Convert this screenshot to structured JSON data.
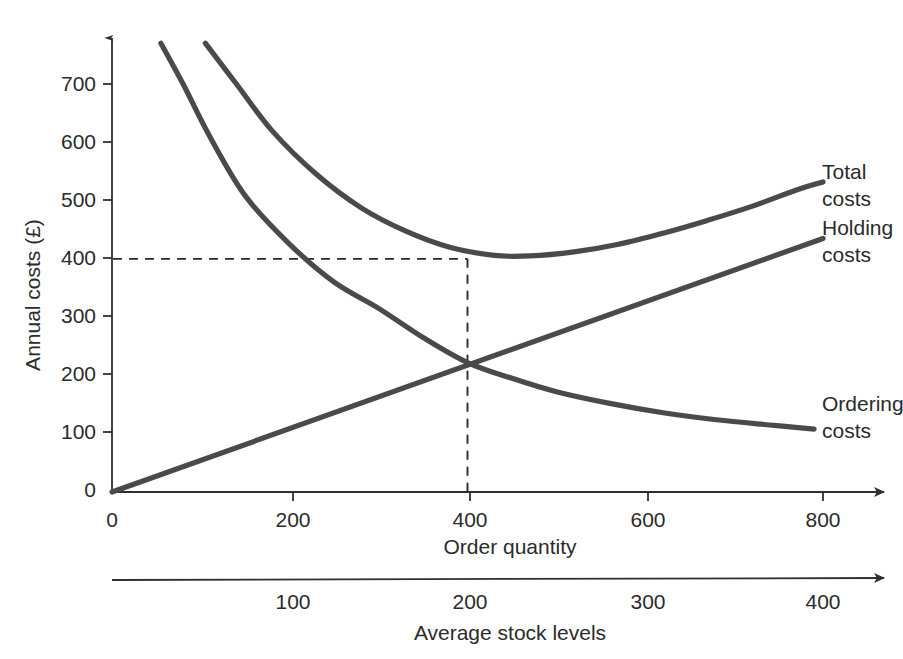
{
  "chart_data": {
    "type": "line",
    "title": "",
    "xlabel": "Order quantity",
    "ylabel": "Annual costs (£)",
    "secondary_xlabel": "Average stock levels",
    "xlim": [
      0,
      880
    ],
    "ylim": [
      0,
      790
    ],
    "grid": false,
    "legend_position": "inline-right",
    "x_ticks": [
      "0",
      "200",
      "400",
      "600",
      "800"
    ],
    "x_tick_values": [
      0,
      200,
      400,
      600,
      800
    ],
    "y_ticks": [
      "0",
      "100",
      "200",
      "300",
      "400",
      "500",
      "600",
      "700"
    ],
    "y_tick_values": [
      0,
      100,
      200,
      300,
      400,
      500,
      600,
      700
    ],
    "secondary_x_ticks": [
      "100",
      "200",
      "300",
      "400"
    ],
    "secondary_x_tick_values": [
      100,
      200,
      300,
      400
    ],
    "annotations": {
      "eoq_x": 400,
      "eoq_total_cost": 400,
      "guide_horizontal_value": 400,
      "guide_vertical_value": 400
    },
    "series": [
      {
        "name": "Ordering costs",
        "label": "Ordering\ncosts",
        "label_line1": "Ordering",
        "label_line2": "costs",
        "color": "#4a4a4a",
        "x": [
          55,
          80,
          110,
          150,
          200,
          250,
          300,
          350,
          400,
          450,
          500,
          560,
          620,
          680,
          740,
          790
        ],
        "y": [
          770,
          700,
          610,
          508,
          425,
          360,
          315,
          265,
          222,
          195,
          172,
          152,
          136,
          124,
          115,
          108
        ]
      },
      {
        "name": "Holding costs",
        "label": "Holding\ncosts",
        "label_line1": "Holding",
        "label_line2": "costs",
        "color": "#4a4a4a",
        "x": [
          0,
          800
        ],
        "y": [
          0,
          435
        ]
      },
      {
        "name": "Total costs",
        "label": "Total\ncosts",
        "label_line1": "Total",
        "label_line2": "costs",
        "color": "#4a4a4a",
        "x": [
          105,
          140,
          180,
          230,
          280,
          330,
          380,
          430,
          470,
          520,
          570,
          620,
          670,
          720,
          770,
          800
        ],
        "y": [
          770,
          700,
          620,
          545,
          488,
          448,
          420,
          406,
          405,
          412,
          425,
          444,
          466,
          490,
          518,
          532
        ]
      }
    ]
  },
  "labels": {
    "y_axis_title": "Annual costs (£)",
    "x_axis_title": "Order quantity",
    "secondary_axis_title": "Average stock levels",
    "total_costs_line1": "Total",
    "total_costs_line2": "costs",
    "holding_costs_line1": "Holding",
    "holding_costs_line2": "costs",
    "ordering_costs_line1": "Ordering",
    "ordering_costs_line2": "costs",
    "y_tick_0": "0",
    "y_tick_100": "100",
    "y_tick_200": "200",
    "y_tick_300": "300",
    "y_tick_400": "400",
    "y_tick_500": "500",
    "y_tick_600": "600",
    "y_tick_700": "700",
    "x_tick_0": "0",
    "x_tick_200": "200",
    "x_tick_400": "400",
    "x_tick_600": "600",
    "x_tick_800": "800",
    "sec_tick_100": "100",
    "sec_tick_200": "200",
    "sec_tick_300": "300",
    "sec_tick_400": "400"
  },
  "colors": {
    "curve": "#4a4a4a",
    "axis": "#2f2f2f",
    "text": "#2b2b2b",
    "background": "#ffffff"
  }
}
